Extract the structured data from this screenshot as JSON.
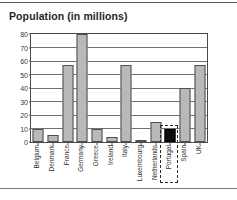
{
  "chart_data": {
    "type": "bar",
    "title": "Population (in millions)",
    "xlabel": "",
    "ylabel": "",
    "ylim": [
      0,
      80
    ],
    "yticks": [
      0,
      10,
      20,
      30,
      40,
      50,
      60,
      70,
      80
    ],
    "grid": true,
    "legend": false,
    "bar_color": "#b9b9b9",
    "bar_border_color": "#4f4f4f",
    "selected_bar_color": "#0d0d0d",
    "selected_category": "Portugal",
    "categories": [
      "Belgium",
      "Denmark",
      "France",
      "Germany",
      "Greece",
      "Ireland",
      "Italy",
      "Luxembourg",
      "Netherlands",
      "Portugal",
      "Spain",
      "UK"
    ],
    "values": [
      10,
      5,
      57,
      80,
      10,
      3.5,
      57,
      0.4,
      15,
      10,
      40,
      57
    ]
  }
}
